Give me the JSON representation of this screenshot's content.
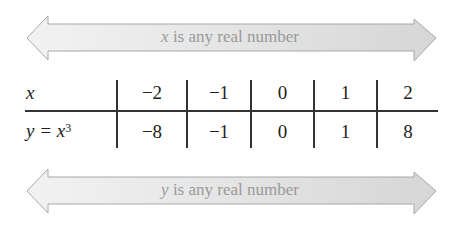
{
  "domain_arrow": {
    "var": "x",
    "text": " is any real number"
  },
  "range_arrow": {
    "var": "y",
    "text": " is any real number"
  },
  "table": {
    "row_labels": {
      "x": "x",
      "y_prefix": "y = x",
      "y_exponent": "3"
    },
    "x_values": [
      "−2",
      "−1",
      "0",
      "1",
      "2"
    ],
    "y_values": [
      "−8",
      "−1",
      "0",
      "1",
      "8"
    ]
  },
  "colors": {
    "arrow_fill": "#e6e6e6",
    "arrow_stroke": "#a8a8a8",
    "arrow_text": "#9a9a9a",
    "table_lines": "#333333"
  }
}
